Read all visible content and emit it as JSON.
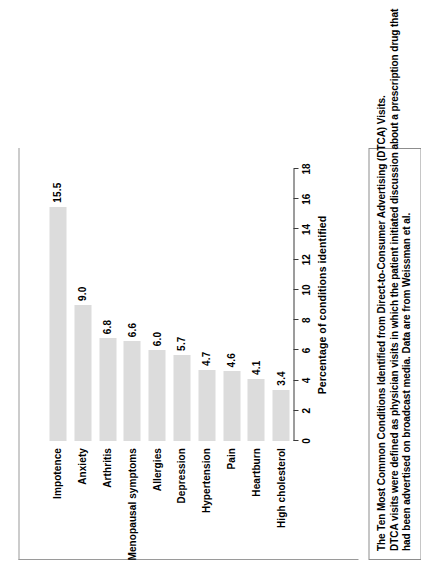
{
  "figure": {
    "caption_lines": [
      "The Ten Most Common Conditions Identified from Direct-to-Consumer Advertising (DTCA) Visits.",
      "DTCA visits were defined as physician visits in which the patient initiated discussion about a prescription drug that",
      "had been advertised on broadcast media. Data are from Weissman et al."
    ]
  },
  "chart_data": {
    "type": "bar",
    "orientation": "horizontal",
    "title": "",
    "xlabel": "Percentage of conditions identified",
    "ylabel": "",
    "xlim": [
      0,
      18
    ],
    "xticks": [
      0,
      2,
      4,
      6,
      8,
      10,
      12,
      14,
      16,
      18
    ],
    "grid": false,
    "legend": false,
    "bar_color": "#dcdcdc",
    "categories": [
      "Impotence",
      "Anxiety",
      "Arthritis",
      "Menopausal symptoms",
      "Allergies",
      "Depression",
      "Hypertension",
      "Pain",
      "Heartburn",
      "High cholesterol"
    ],
    "values": [
      15.5,
      9.0,
      6.8,
      6.6,
      6.0,
      5.7,
      4.7,
      4.6,
      4.1,
      3.4
    ],
    "value_labels": [
      "15.5",
      "9.0",
      "6.8",
      "6.6",
      "6.0",
      "5.7",
      "4.7",
      "4.6",
      "4.1",
      "3.4"
    ]
  }
}
